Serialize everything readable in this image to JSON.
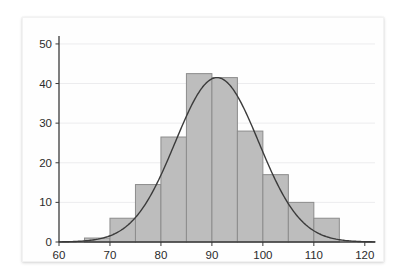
{
  "figure": {
    "background_color": "#ffffff",
    "card_background": "#fefefe",
    "bar_fill_color": "#bdbdbd",
    "bar_border_color": "#8c8c8c",
    "curve_color": "#3b3b3b",
    "grid_color": "#ececee",
    "axis_color": "#3a3a3a"
  },
  "chart_data": {
    "type": "bar",
    "title": "",
    "subtitle": "",
    "xlabel": "",
    "ylabel": "",
    "xlim": [
      60,
      122
    ],
    "ylim": [
      0,
      52
    ],
    "grid": true,
    "legend": "none",
    "bin_width": 5,
    "x_ticks": [
      60,
      70,
      80,
      90,
      100,
      110,
      120
    ],
    "x_tick_labels": [
      "60",
      "70",
      "80",
      "90",
      "100",
      "110",
      "120"
    ],
    "y_ticks": [
      0,
      10,
      20,
      30,
      40,
      50
    ],
    "y_tick_labels": [
      "0",
      "10",
      "20",
      "30",
      "40",
      "50"
    ],
    "categories": [
      "60-65",
      "65-70",
      "70-75",
      "75-80",
      "80-85",
      "85-90",
      "90-95",
      "95-100",
      "100-105",
      "105-110",
      "110-115",
      "115-120"
    ],
    "bin_edges": [
      60,
      65,
      70,
      75,
      80,
      85,
      90,
      95,
      100,
      105,
      110,
      115,
      120
    ],
    "values": [
      0,
      1,
      6,
      14.5,
      26.5,
      42.5,
      41.5,
      28,
      17,
      10,
      6,
      0
    ],
    "overlay": {
      "type": "line",
      "name": "normal density curve",
      "mean": 91,
      "sigma": 8.2,
      "peak_value": 41.5,
      "peak_x": 91
    }
  }
}
